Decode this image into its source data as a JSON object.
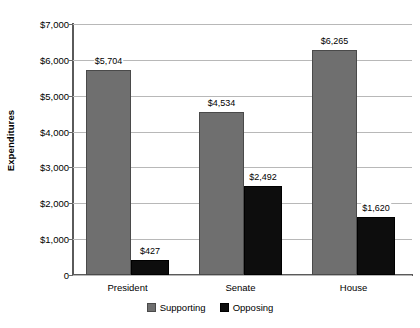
{
  "chart_data": {
    "type": "bar",
    "title": "",
    "xlabel": "",
    "ylabel": "Expenditures",
    "categories": [
      "President",
      "Senate",
      "House"
    ],
    "series": [
      {
        "name": "Supporting",
        "color": "#6f6f6f",
        "values": [
          5704,
          4534,
          6265
        ],
        "labels": [
          "$5,704",
          "$4,534",
          "$6,265"
        ]
      },
      {
        "name": "Opposing",
        "color": "#0d0d0d",
        "values": [
          427,
          2492,
          1620
        ],
        "labels": [
          "$427",
          "$2,492",
          "$1,620"
        ]
      }
    ],
    "ylim": [
      0,
      7000
    ],
    "ytick_values": [
      7000,
      6000,
      5000,
      4000,
      3000,
      2000,
      1000,
      0
    ],
    "ytick_labels": [
      "$7,000",
      "$6,000",
      "$5,000",
      "$4,000",
      "$3,000",
      "$2,000",
      "$1,000",
      "0"
    ],
    "grid": "horizontal",
    "legend_position": "bottom-center"
  }
}
